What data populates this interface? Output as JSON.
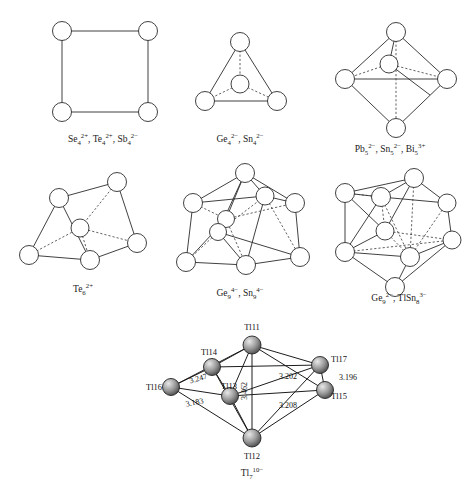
{
  "figure": {
    "background_color": "#ffffff",
    "line_color": "#2b2b2b"
  },
  "structures": [
    {
      "id": "square",
      "name": "square-planar-cluster",
      "geometry": "square",
      "vertex_count": 4,
      "caption": {
        "parts": [
          {
            "base": "Se",
            "sub": "4",
            "sup": "2+"
          },
          {
            "base": "Te",
            "sub": "4",
            "sup": "2+"
          },
          {
            "base": "Sb",
            "sub": "4",
            "sup": "2−"
          }
        ],
        "text": "Se42+, Te42+, Sb42−"
      }
    },
    {
      "id": "tetrahedron",
      "name": "tetrahedral-cluster",
      "geometry": "tetrahedron",
      "vertex_count": 4,
      "caption": {
        "parts": [
          {
            "base": "Ge",
            "sub": "4",
            "sup": "2−"
          },
          {
            "base": "Sn",
            "sub": "4",
            "sup": "2−"
          }
        ],
        "text": "Ge42−, Sn42−"
      }
    },
    {
      "id": "trigonal-bipyramid",
      "name": "trigonal-bipyramidal-cluster",
      "geometry": "trigonal bipyramid",
      "vertex_count": 5,
      "caption": {
        "parts": [
          {
            "base": "Pb",
            "sub": "5",
            "sup": "2−"
          },
          {
            "base": "Sn",
            "sub": "5",
            "sup": "2−"
          },
          {
            "base": "Bi",
            "sub": "5",
            "sup": "3+"
          }
        ],
        "text": "Pb52−, Sn52−, Bi53+"
      }
    },
    {
      "id": "trigonal-prism",
      "name": "trigonal-prismatic-cluster",
      "geometry": "trigonal prism",
      "vertex_count": 6,
      "caption": {
        "parts": [
          {
            "base": "Te",
            "sub": "6",
            "sup": "2+"
          }
        ],
        "text": "Te62+"
      }
    },
    {
      "id": "monocapped-square-antiprism",
      "name": "monocapped-square-antiprism-cluster",
      "geometry": "monocapped square antiprism",
      "vertex_count": 9,
      "caption": {
        "parts": [
          {
            "base": "Ge",
            "sub": "9",
            "sup": "4−"
          },
          {
            "base": "Sn",
            "sub": "9",
            "sup": "4−"
          }
        ],
        "text": "Ge94−, Sn94−"
      }
    },
    {
      "id": "tricapped-trigonal-prism",
      "name": "tricapped-trigonal-prism-cluster",
      "geometry": "tricapped trigonal prism",
      "vertex_count": 9,
      "caption": {
        "parts": [
          {
            "base": "Ge",
            "sub": "9",
            "sup": "2−"
          },
          {
            "base": "TlSn",
            "sub": "8",
            "sup": "3−"
          }
        ],
        "text": "Ge92−, TlSn83−"
      }
    }
  ],
  "tl7": {
    "name": "tl7-pentagonal-bipyramid",
    "geometry": "pentagonal bipyramid",
    "caption": {
      "parts": [
        {
          "base": "Tl",
          "sub": "7",
          "sup": "10−"
        }
      ],
      "text": "Tl710−"
    },
    "atom_labels": [
      {
        "id": "tl11",
        "text": "Tl11"
      },
      {
        "id": "tl14",
        "text": "Tl14"
      },
      {
        "id": "tl16",
        "text": "Tl16"
      },
      {
        "id": "tl13",
        "text": "Tl13"
      },
      {
        "id": "tl12",
        "text": "Tl12"
      },
      {
        "id": "tl17",
        "text": "Tl17"
      },
      {
        "id": "tl15",
        "text": "Tl15"
      }
    ],
    "distances": [
      {
        "id": "d-3-247",
        "value": "3.247"
      },
      {
        "id": "d-3-462",
        "value": "3.462"
      },
      {
        "id": "d-3-202",
        "value": "3.202"
      },
      {
        "id": "d-3-196",
        "value": "3.196"
      },
      {
        "id": "d-3-183",
        "value": "3.183"
      },
      {
        "id": "d-3-208",
        "value": "3.208"
      }
    ]
  }
}
